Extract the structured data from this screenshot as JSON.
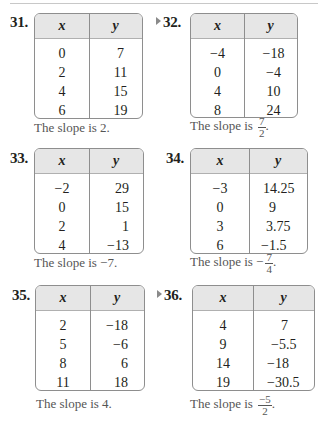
{
  "problems": [
    {
      "number": "31.",
      "has_marker": false,
      "headers": [
        "x",
        "y"
      ],
      "x": [
        "0",
        "2",
        "4",
        "6"
      ],
      "y": [
        "7",
        "11",
        "15",
        "19"
      ],
      "slope_prefix": "The slope is ",
      "slope_value": "2",
      "slope_suffix": "."
    },
    {
      "number": "32.",
      "has_marker": true,
      "headers": [
        "x",
        "y"
      ],
      "x": [
        "−4",
        "0",
        "4",
        "8"
      ],
      "y": [
        "−18",
        "−4",
        "10",
        "24"
      ],
      "slope_prefix": "The slope is ",
      "slope_fraction": {
        "numerator": "7",
        "denominator": "2",
        "sign": ""
      },
      "slope_suffix": "."
    },
    {
      "number": "33.",
      "has_marker": false,
      "headers": [
        "x",
        "y"
      ],
      "x": [
        "−2",
        "0",
        "2",
        "4"
      ],
      "y": [
        "29",
        "15",
        "1",
        "−13"
      ],
      "slope_prefix": "The slope is ",
      "slope_value": "−7",
      "slope_suffix": "."
    },
    {
      "number": "34.",
      "has_marker": false,
      "headers": [
        "x",
        "y"
      ],
      "x": [
        "−3",
        "0",
        "3",
        "6"
      ],
      "y": [
        "14.25",
        "9",
        "3.75",
        "−1.5"
      ],
      "slope_prefix": "The slope is ",
      "slope_fraction": {
        "numerator": "7",
        "denominator": "4",
        "sign": "−"
      },
      "slope_suffix": "."
    },
    {
      "number": "35.",
      "has_marker": false,
      "headers": [
        "x",
        "y"
      ],
      "x": [
        "2",
        "5",
        "8",
        "11"
      ],
      "y": [
        "−18",
        "−6",
        "6",
        "18"
      ],
      "slope_prefix": "The slope is ",
      "slope_value": "4",
      "slope_suffix": "."
    },
    {
      "number": "36.",
      "has_marker": true,
      "headers": [
        "x",
        "y"
      ],
      "x": [
        "4",
        "9",
        "14",
        "19"
      ],
      "y": [
        "7",
        "−5.5",
        "−18",
        "−30.5"
      ],
      "slope_prefix": "The slope is ",
      "slope_fraction": {
        "numerator": "−5",
        "denominator": "2",
        "sign": ""
      },
      "slope_suffix": "."
    }
  ]
}
